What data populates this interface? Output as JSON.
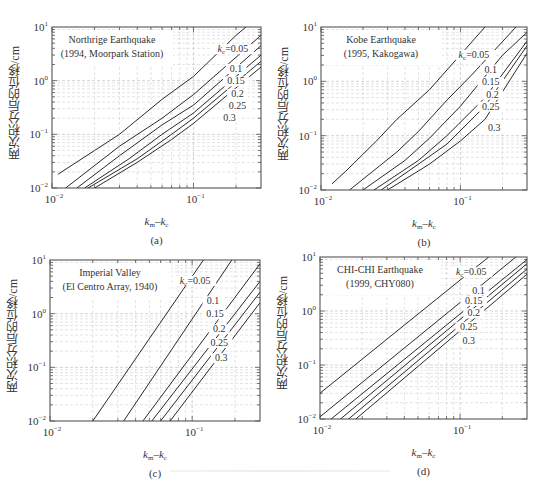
{
  "figure": {
    "y_axis_label": "两次积分后的位移/cm",
    "x_axis_label_k": "k",
    "x_axis_label_sub1": "m",
    "x_axis_label_sub2": "c",
    "x_axis_label_dash": "–",
    "kc_prefix_k": "k",
    "kc_prefix_sub": "c",
    "kc_prefix_eq": "=0.05",
    "x_ticks": [
      {
        "base": "10",
        "exp": "−2",
        "value": 0.01
      },
      {
        "base": "10",
        "exp": "−1",
        "value": 0.1
      }
    ],
    "y_ticks": [
      {
        "base": "10",
        "exp": "1",
        "value": 10
      },
      {
        "base": "10",
        "exp": "0",
        "value": 1
      },
      {
        "base": "10",
        "exp": "−1",
        "value": 0.1
      },
      {
        "base": "10",
        "exp": "−2",
        "value": 0.01
      }
    ],
    "colors": {
      "line": "#2a2a2a",
      "grid": "#c8c8c8",
      "frame": "#555555",
      "text": "#333333"
    }
  },
  "chart_data": [
    {
      "type": "line",
      "panel": "(a)",
      "title": "Northrige Earthquake",
      "subtitle": "(1994, Moorpark Station)",
      "xlabel": "km–kc",
      "ylabel": "两次积分后的位移/cm",
      "xscale": "log",
      "yscale": "log",
      "xlim": [
        0.01,
        0.3
      ],
      "ylim": [
        0.01,
        10
      ],
      "grid": true,
      "series": [
        {
          "name": "kc=0.05",
          "label": "0.05",
          "x": [
            0.011,
            0.02,
            0.03,
            0.06,
            0.1,
            0.2,
            0.235
          ],
          "y": [
            0.018,
            0.05,
            0.1,
            0.45,
            1.2,
            7,
            10
          ]
        },
        {
          "name": "kc=0.1",
          "label": "0.1",
          "x": [
            0.0125,
            0.03,
            0.06,
            0.1,
            0.3
          ],
          "y": [
            0.01,
            0.06,
            0.2,
            0.55,
            7
          ]
        },
        {
          "name": "kc=0.15",
          "label": "0.15",
          "x": [
            0.015,
            0.03,
            0.06,
            0.1,
            0.3
          ],
          "y": [
            0.01,
            0.04,
            0.15,
            0.35,
            4.5
          ]
        },
        {
          "name": "kc=0.2",
          "label": "0.2",
          "x": [
            0.017,
            0.035,
            0.06,
            0.1,
            0.3
          ],
          "y": [
            0.01,
            0.035,
            0.1,
            0.25,
            3
          ]
        },
        {
          "name": "kc=0.25",
          "label": "0.25",
          "x": [
            0.018,
            0.04,
            0.07,
            0.1,
            0.3
          ],
          "y": [
            0.01,
            0.035,
            0.1,
            0.2,
            2.3
          ]
        },
        {
          "name": "kc=0.3",
          "label": "0.3",
          "x": [
            0.02,
            0.04,
            0.07,
            0.1,
            0.3
          ],
          "y": [
            0.01,
            0.03,
            0.08,
            0.16,
            1.8
          ]
        }
      ],
      "label_pos": [
        [
          0.19,
          3.4
        ],
        [
          0.2,
          1.45
        ],
        [
          0.2,
          0.85
        ],
        [
          0.205,
          0.5
        ],
        [
          0.205,
          0.3
        ],
        [
          0.18,
          0.18
        ]
      ]
    },
    {
      "type": "line",
      "panel": "(b)",
      "title": "Kobe Earthquake",
      "subtitle": "(1995, Kakogawa)",
      "xlabel": "km–kc",
      "ylabel": "两次积分后的位移/cm",
      "xscale": "log",
      "yscale": "log",
      "xlim": [
        0.01,
        0.3
      ],
      "ylim": [
        0.01,
        10
      ],
      "grid": true,
      "series": [
        {
          "name": "kc=0.05",
          "label": "0.05",
          "x": [
            0.012,
            0.015,
            0.025,
            0.035,
            0.06,
            0.15
          ],
          "y": [
            0.013,
            0.022,
            0.08,
            0.2,
            0.7,
            10
          ]
        },
        {
          "name": "kc=0.1",
          "label": "0.1",
          "x": [
            0.016,
            0.035,
            0.05,
            0.08,
            0.12,
            0.25
          ],
          "y": [
            0.01,
            0.05,
            0.12,
            0.45,
            1.3,
            10
          ]
        },
        {
          "name": "kc=0.15",
          "label": "0.15",
          "x": [
            0.02,
            0.04,
            0.06,
            0.1,
            0.2,
            0.3
          ],
          "y": [
            0.01,
            0.035,
            0.09,
            0.35,
            3,
            8
          ]
        },
        {
          "name": "kc=0.2",
          "label": "0.2",
          "x": [
            0.024,
            0.05,
            0.08,
            0.15,
            0.3
          ],
          "y": [
            0.01,
            0.035,
            0.1,
            0.5,
            5.5
          ]
        },
        {
          "name": "kc=0.25",
          "label": "0.25",
          "x": [
            0.027,
            0.05,
            0.08,
            0.15,
            0.3
          ],
          "y": [
            0.01,
            0.03,
            0.07,
            0.35,
            4.5
          ]
        },
        {
          "name": "kc=0.3",
          "label": "0.3",
          "x": [
            0.03,
            0.06,
            0.1,
            0.15,
            0.3
          ],
          "y": [
            0.01,
            0.03,
            0.08,
            0.2,
            3.3
          ]
        }
      ],
      "label_pos": [
        [
          0.125,
          2.7
        ],
        [
          0.165,
          1.45
        ],
        [
          0.165,
          0.85
        ],
        [
          0.17,
          0.5
        ],
        [
          0.165,
          0.3
        ],
        [
          0.175,
          0.12
        ]
      ]
    },
    {
      "type": "line",
      "panel": "(c)",
      "title": "Imperial Valley",
      "subtitle": "(El Centro Array, 1940)",
      "xlabel": "km–kc",
      "ylabel": "两次积分后的位移/cm",
      "xscale": "log",
      "yscale": "log",
      "xlim": [
        0.01,
        0.3
      ],
      "ylim": [
        0.01,
        10
      ],
      "grid": true,
      "series": [
        {
          "name": "kc=0.05",
          "label": "0.05",
          "x": [
            0.02,
            0.12
          ],
          "y": [
            0.01,
            10
          ]
        },
        {
          "name": "kc=0.1",
          "label": "0.1",
          "x": [
            0.033,
            0.19
          ],
          "y": [
            0.01,
            10
          ]
        },
        {
          "name": "kc=0.15",
          "label": "0.15",
          "x": [
            0.045,
            0.3
          ],
          "y": [
            0.01,
            8.5
          ]
        },
        {
          "name": "kc=0.2",
          "label": "0.2",
          "x": [
            0.052,
            0.3
          ],
          "y": [
            0.01,
            4
          ]
        },
        {
          "name": "kc=0.25",
          "label": "0.25",
          "x": [
            0.06,
            0.3
          ],
          "y": [
            0.01,
            2.5
          ]
        },
        {
          "name": "kc=0.3",
          "label": "0.3",
          "x": [
            0.07,
            0.3
          ],
          "y": [
            0.01,
            1.6
          ]
        }
      ],
      "label_pos": [
        [
          0.105,
          3.6
        ],
        [
          0.14,
          1.5
        ],
        [
          0.145,
          0.85
        ],
        [
          0.155,
          0.45
        ],
        [
          0.155,
          0.25
        ],
        [
          0.16,
          0.13
        ]
      ]
    },
    {
      "type": "line",
      "panel": "(d)",
      "title": "CHI-CHI Earthquake",
      "subtitle": "(1999, CHY080)",
      "xlabel": "km–kc",
      "ylabel": "两次积分后的位移/cm",
      "xscale": "log",
      "yscale": "log",
      "xlim": [
        0.01,
        0.3
      ],
      "ylim": [
        0.01,
        10
      ],
      "grid": true,
      "series": [
        {
          "name": "kc=0.05",
          "label": "0.05",
          "x": [
            0.01,
            0.16
          ],
          "y": [
            0.03,
            10
          ]
        },
        {
          "name": "kc=0.1",
          "label": "0.1",
          "x": [
            0.01,
            0.25
          ],
          "y": [
            0.011,
            10
          ]
        },
        {
          "name": "kc=0.15",
          "label": "0.15",
          "x": [
            0.012,
            0.3
          ],
          "y": [
            0.01,
            9
          ]
        },
        {
          "name": "kc=0.2",
          "label": "0.2",
          "x": [
            0.014,
            0.3
          ],
          "y": [
            0.01,
            7.5
          ]
        },
        {
          "name": "kc=0.25",
          "label": "0.25",
          "x": [
            0.016,
            0.3
          ],
          "y": [
            0.01,
            6
          ]
        },
        {
          "name": "kc=0.3",
          "label": "0.3",
          "x": [
            0.018,
            0.3
          ],
          "y": [
            0.01,
            4.8
          ]
        }
      ],
      "label_pos": [
        [
          0.12,
          4.6
        ],
        [
          0.135,
          2.1
        ],
        [
          0.125,
          1.35
        ],
        [
          0.125,
          0.8
        ],
        [
          0.115,
          0.45
        ],
        [
          0.115,
          0.25
        ]
      ]
    }
  ]
}
